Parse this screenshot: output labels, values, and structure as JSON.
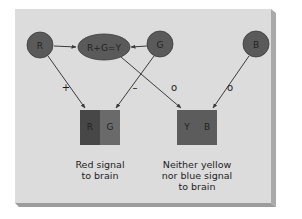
{
  "colors": {
    "panel": "#dcdcdc",
    "panel_edge_right": "#a9a9a9",
    "panel_edge_bottom": "#9c9c9c",
    "node_fill": "#5a5a5a",
    "node_stroke": "#3a3a3a",
    "box_dark": "#474747",
    "box_light": "#6a6a6a",
    "box_mid": "#5c5c5c",
    "arrow": "#3a3a3a"
  },
  "nodes": {
    "r": "R",
    "g": "G",
    "b": "B",
    "combo": "R+G=Y"
  },
  "signs": {
    "r_to_box1": "+",
    "g_to_box1": "–",
    "combo_to_box2": "o",
    "b_to_box2": "o"
  },
  "boxes": {
    "box1": {
      "left": "R",
      "right": "G"
    },
    "box2": {
      "left": "Y",
      "right": "B"
    }
  },
  "captions": {
    "box1_line1": "Red signal",
    "box1_line2": "to brain",
    "box2_line1": "Neither yellow",
    "box2_line2": "nor blue signal",
    "box2_line3": "to brain"
  }
}
